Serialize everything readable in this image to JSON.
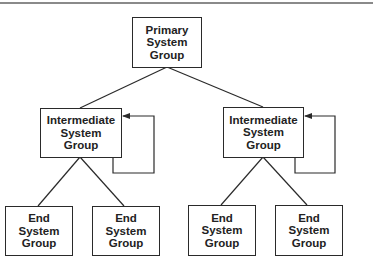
{
  "diagram": {
    "type": "hierarchy",
    "colors": {
      "line": "#2a2a2a",
      "text": "#222222",
      "rule": "#8a8a8a"
    },
    "nodes": {
      "primary": {
        "lines": [
          "Primary",
          "System",
          "Group"
        ]
      },
      "intermediate_left": {
        "lines": [
          "Intermediate",
          "System",
          "Group"
        ]
      },
      "intermediate_right": {
        "lines": [
          "Intermediate",
          "System",
          "Group"
        ]
      },
      "end_1": {
        "lines": [
          "End",
          "System",
          "Group"
        ]
      },
      "end_2": {
        "lines": [
          "End",
          "System",
          "Group"
        ]
      },
      "end_3": {
        "lines": [
          "End",
          "System",
          "Group"
        ]
      },
      "end_4": {
        "lines": [
          "End",
          "System",
          "Group"
        ]
      }
    },
    "edges": [
      {
        "from": "primary",
        "to": "intermediate_left"
      },
      {
        "from": "primary",
        "to": "intermediate_right"
      },
      {
        "from": "intermediate_left",
        "to": "end_1"
      },
      {
        "from": "intermediate_left",
        "to": "end_2"
      },
      {
        "from": "intermediate_right",
        "to": "end_3"
      },
      {
        "from": "intermediate_right",
        "to": "end_4"
      },
      {
        "from": "intermediate_left",
        "to": "intermediate_left",
        "kind": "self-loop-arrow"
      },
      {
        "from": "intermediate_right",
        "to": "intermediate_right",
        "kind": "self-loop-arrow"
      }
    ]
  }
}
